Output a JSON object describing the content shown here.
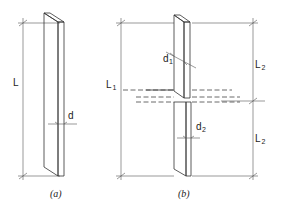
{
  "figure_a": {
    "caption": "(a)",
    "length_label": "L",
    "thickness_label": "d"
  },
  "figure_b": {
    "caption": "(b)",
    "total_length_label": "L",
    "total_length_sub": "1",
    "upper_length_label": "L",
    "upper_length_sub": "2",
    "lower_length_label": "L",
    "lower_length_sub": "2",
    "upper_thickness_label": "d",
    "upper_thickness_sub": "1",
    "lower_thickness_label": "d",
    "lower_thickness_sub": "2"
  },
  "colors": {
    "line": "#333333",
    "background": "#ffffff"
  }
}
